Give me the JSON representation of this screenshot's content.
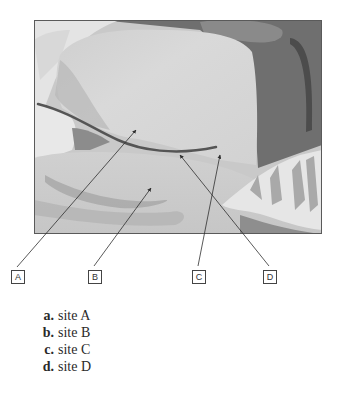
{
  "figure": {
    "labels": [
      {
        "id": "A",
        "text": "A"
      },
      {
        "id": "B",
        "text": "B"
      },
      {
        "id": "C",
        "text": "C"
      },
      {
        "id": "D",
        "text": "D"
      }
    ],
    "colors": {
      "frame": "#5a5a5a",
      "drape_light": "#d6d6d6",
      "background_dark": "#6e6e6e",
      "arrow": "#3a3a3a"
    }
  },
  "options": [
    {
      "letter": "a.",
      "text": "site A"
    },
    {
      "letter": "b.",
      "text": "site B"
    },
    {
      "letter": "c.",
      "text": "site C"
    },
    {
      "letter": "d.",
      "text": "site D"
    }
  ]
}
